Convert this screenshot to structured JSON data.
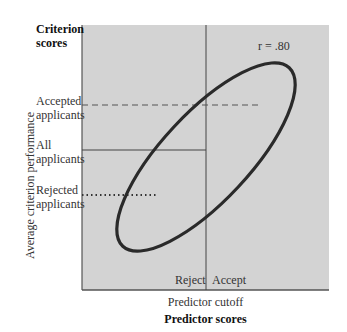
{
  "figure": {
    "y_axis_title": "Criterion scores",
    "y_axis_title_line1": "Criterion",
    "y_axis_title_line2": "scores",
    "y_axis_label": "Average criterion performance",
    "x_axis_title": "Predictor scores",
    "x_axis_sublabel": "Predictor cutoff",
    "correlation_label": "r = .80",
    "region_labels": {
      "reject": "Reject",
      "accept": "Accept"
    },
    "group_labels": {
      "accepted_line1": "Accepted",
      "accepted_line2": "applicants",
      "all_line1": "All",
      "all_line2": "applicants",
      "rejected_line1": "Rejected",
      "rejected_line2": "applicants"
    },
    "colors": {
      "plot_background": "#d3d3d3",
      "ellipse_stroke": "#2a2a2a",
      "line_stroke": "#444444"
    }
  }
}
